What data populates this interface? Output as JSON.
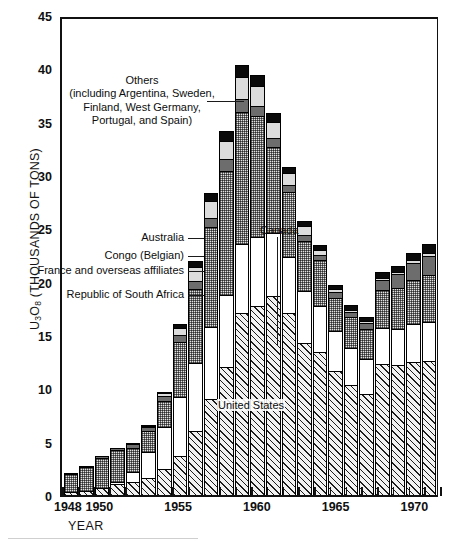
{
  "axes": {
    "y_title_main": "U",
    "y_title_full": "U3O8 (THOUSANDS OF TONS)",
    "y_ticks": [
      0,
      5,
      10,
      15,
      20,
      25,
      30,
      35,
      40,
      45
    ],
    "x_title": "YEAR",
    "x_tick_labels": [
      "1948",
      "1950",
      "1955",
      "1960",
      "1965",
      "1970"
    ]
  },
  "annotations": {
    "others": "Others\n(including Argentina, Sweden,\nFinland, West Germany,\nPortugal, and Spain)",
    "others_l1": "Others",
    "others_l2": "(including Argentina, Sweden,",
    "others_l3": "Finland, West Germany,",
    "others_l4": "Portugal, and Spain)",
    "australia": "Australia",
    "congo": "Congo (Belgian)",
    "france": "France and overseas affiliates",
    "south_africa": "Republic of South Africa",
    "canada": "Canada",
    "united_states": "United States"
  },
  "colors": {
    "united_states": "#f2f2f2",
    "south_africa": "#ffffff",
    "france": "#e2e2e2",
    "congo": "#6d6d6d",
    "australia": "#dcdcdc",
    "others": "#0a0a0a",
    "axis": "#111111"
  },
  "chart_data": {
    "type": "bar",
    "subtype": "stacked-vertical",
    "title": "",
    "xlabel": "YEAR",
    "ylabel": "U3O8 (THOUSANDS OF TONS)",
    "ylim": [
      0,
      45
    ],
    "yticks": [
      0,
      5,
      10,
      15,
      20,
      25,
      30,
      35,
      40,
      45
    ],
    "grid": false,
    "legend": "in-figure leader-line annotations",
    "categories": [
      1948,
      1949,
      1950,
      1951,
      1952,
      1953,
      1954,
      1955,
      1956,
      1957,
      1958,
      1959,
      1960,
      1961,
      1962,
      1963,
      1964,
      1965,
      1966,
      1967,
      1968,
      1969,
      1970,
      1971
    ],
    "stack_order_bottom_to_top": [
      "United States",
      "Republic of South Africa",
      "France and overseas affiliates",
      "Congo (Belgian)",
      "Australia",
      "Others"
    ],
    "series": [
      {
        "name": "United States",
        "values": [
          0.2,
          0.3,
          0.6,
          0.9,
          1.1,
          1.5,
          2.3,
          3.6,
          5.9,
          8.9,
          11.9,
          17.0,
          17.6,
          18.6,
          17.0,
          14.2,
          13.3,
          11.5,
          10.2,
          9.4,
          12.2,
          12.1,
          12.4,
          12.5
        ],
        "fill": "diagonal-hatch"
      },
      {
        "name": "Republic of South Africa",
        "values": [
          0.0,
          0.0,
          0.0,
          0.2,
          1.0,
          2.4,
          4.0,
          5.5,
          6.4,
          6.8,
          6.8,
          6.4,
          6.5,
          5.9,
          5.2,
          4.8,
          4.3,
          3.8,
          3.5,
          3.3,
          3.4,
          3.4,
          3.5,
          3.6
        ],
        "fill": "white"
      },
      {
        "name": "France and overseas affiliates",
        "values": [
          1.7,
          2.2,
          2.8,
          3.0,
          2.2,
          2.0,
          2.4,
          5.2,
          6.9,
          9.3,
          11.6,
          12.4,
          11.3,
          8.0,
          6.1,
          4.7,
          4.3,
          3.1,
          2.9,
          2.8,
          3.5,
          3.8,
          4.2,
          4.4
        ],
        "fill": "fine-stipple-gray"
      },
      {
        "name": "Congo (Belgian)",
        "values": [
          0.15,
          0.2,
          0.25,
          0.3,
          0.35,
          0.4,
          0.5,
          0.6,
          0.8,
          0.9,
          1.1,
          1.2,
          1.0,
          0.9,
          0.7,
          0.6,
          0.5,
          0.5,
          0.5,
          0.5,
          1.0,
          1.3,
          1.6,
          1.8
        ],
        "fill": "dark-gray"
      },
      {
        "name": "Australia",
        "values": [
          0.0,
          0.0,
          0.0,
          0.0,
          0.05,
          0.1,
          0.3,
          0.7,
          1.3,
          1.6,
          1.7,
          2.1,
          1.9,
          1.5,
          1.1,
          0.8,
          0.5,
          0.3,
          0.2,
          0.2,
          0.2,
          0.2,
          0.2,
          0.3
        ],
        "fill": "light-gray"
      },
      {
        "name": "Others",
        "values": [
          0.0,
          0.0,
          0.0,
          0.0,
          0.0,
          0.1,
          0.2,
          0.4,
          0.6,
          0.8,
          1.0,
          1.2,
          1.1,
          0.9,
          0.7,
          0.6,
          0.5,
          0.5,
          0.5,
          0.5,
          0.6,
          0.7,
          0.8,
          0.9
        ],
        "fill": "black"
      }
    ],
    "totals": [
      2.05,
      2.7,
      3.65,
      4.4,
      4.7,
      6.5,
      9.7,
      16.0,
      21.9,
      28.3,
      34.1,
      40.3,
      39.4,
      35.8,
      30.8,
      25.7,
      23.4,
      19.7,
      17.8,
      16.7,
      20.9,
      21.5,
      22.7,
      23.5
    ]
  }
}
